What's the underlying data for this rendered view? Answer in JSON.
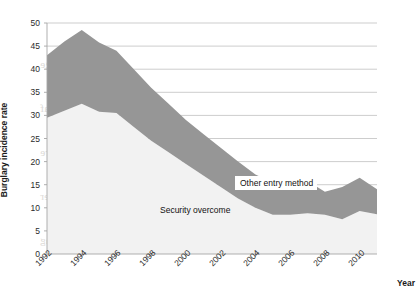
{
  "chart_data": {
    "type": "area",
    "stacked": true,
    "title": "",
    "xlabel": "Year",
    "ylabel": "Burglary incidence rate",
    "xlim": [
      1992,
      2011
    ],
    "ylim": [
      0,
      50
    ],
    "ytick_step": 5,
    "yticks": [
      0,
      5,
      10,
      15,
      20,
      25,
      30,
      35,
      40,
      45,
      50
    ],
    "xticks": [
      1992,
      1994,
      1996,
      1998,
      2000,
      2002,
      2004,
      2006,
      2008,
      2010
    ],
    "grid": "horizontal",
    "legend_position": "inline-annotations",
    "x": [
      1992,
      1993,
      1994,
      1995,
      1996,
      1997,
      1998,
      1999,
      2000,
      2001,
      2002,
      2003,
      2004,
      2005,
      2006,
      2007,
      2008,
      2009,
      2010,
      2011
    ],
    "series": [
      {
        "name": "Security overcome",
        "color": "#f2f2f2",
        "values": [
          29.5,
          31.0,
          32.5,
          30.8,
          30.5,
          27.5,
          24.5,
          22.0,
          19.5,
          17.0,
          14.5,
          12.0,
          10.0,
          8.5,
          8.5,
          8.8,
          8.5,
          7.5,
          9.3,
          8.6
        ]
      },
      {
        "name": "Other entry method",
        "color": "#969696",
        "values": [
          13.5,
          15.0,
          16.0,
          15.0,
          13.5,
          12.5,
          11.5,
          10.5,
          9.5,
          9.0,
          8.5,
          8.0,
          7.2,
          7.0,
          7.0,
          7.0,
          5.0,
          7.0,
          7.2,
          5.4
        ]
      }
    ],
    "totals": [
      43.0,
      46.0,
      48.5,
      45.8,
      44.0,
      40.0,
      36.0,
      32.5,
      29.0,
      26.0,
      23.0,
      20.0,
      17.2,
      15.5,
      15.5,
      15.8,
      13.5,
      14.5,
      16.5,
      14.0
    ],
    "annotations": [
      {
        "text": "Other entry method",
        "target_series": "Other entry method"
      },
      {
        "text": "Security overcome",
        "target_series": "Security overcome"
      }
    ]
  },
  "axes": {
    "ylabel": "Burglary incidence rate",
    "xlabel": "Year",
    "ytick_labels": [
      "0",
      "5",
      "10",
      "15",
      "20",
      "25",
      "30",
      "35",
      "40",
      "45",
      "50"
    ],
    "xtick_labels": [
      "1992",
      "1994",
      "1996",
      "1998",
      "2000",
      "2002",
      "2004",
      "2006",
      "2008",
      "2010"
    ]
  },
  "labels": {
    "other_entry_method": "Other entry method",
    "security_overcome": "Security overcome"
  },
  "colors": {
    "upper_band": "#969696",
    "lower_band": "#f2f2f2",
    "gridline": "#b7b7b7",
    "axis": "#a6a6a6",
    "text": "#1a1a1a",
    "page": "#ffffff"
  },
  "bleed_text": [
    "the reverse of the printed page",
    "faint show-through lines of text",
    "from the opposite side of the leaf",
    "appear behind the chart area here",
    "and continue across the figure",
    "in a lighter grey tone overall",
    "visible through the thin paper",
    "of this scanned book page",
    "as ghosted mirrored writing"
  ]
}
